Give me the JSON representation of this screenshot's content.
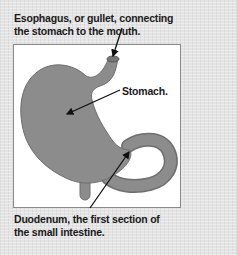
{
  "diagram": {
    "labels": {
      "esophagus": "Esophagus, or gullet, connecting the stomach to the mouth.",
      "stomach": "Stomach.",
      "duodenum": "Duodenum, the first section of the small intestine."
    },
    "colors": {
      "background": "#e4e4e4",
      "panel": "#ffffff",
      "organ_fill": "#8c8c8c",
      "organ_stroke": "#6e6e6e",
      "text": "#1a1a1a"
    }
  }
}
